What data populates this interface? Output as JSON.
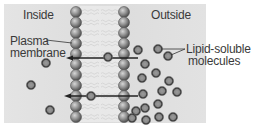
{
  "diagram": {
    "labels": {
      "inside": "Inside",
      "outside": "Outside",
      "plasma_membrane_line1": "Plasma",
      "plasma_membrane_line2": "membrane",
      "lipid_soluble_line1": "Lipid-soluble",
      "lipid_soluble_line2": "molecules"
    },
    "colors": {
      "panel": "#dedede",
      "head": "#8a8a8a",
      "molecule": "#7a7a7a",
      "arrow": "#222222",
      "text": "#3a3a3a"
    },
    "membrane": {
      "left_head_x": 76,
      "right_head_x": 124,
      "head_radius": 5.5,
      "head_ys": [
        12,
        22.5,
        33,
        43.5,
        54,
        64.5,
        75,
        85.5,
        96,
        106.5,
        117
      ]
    },
    "arrows": [
      {
        "y": 58,
        "from_x": 138,
        "to_x": 66
      },
      {
        "y": 96,
        "from_x": 138,
        "to_x": 64
      }
    ],
    "molecules_inside": [
      {
        "x": 46,
        "y": 63
      },
      {
        "x": 31,
        "y": 85
      },
      {
        "x": 50,
        "y": 110
      }
    ],
    "molecules_in_membrane": [
      {
        "x": 108,
        "y": 57
      },
      {
        "x": 91,
        "y": 96
      }
    ],
    "molecules_outside": [
      {
        "x": 138,
        "y": 50
      },
      {
        "x": 158,
        "y": 49
      },
      {
        "x": 168,
        "y": 56
      },
      {
        "x": 145,
        "y": 64
      },
      {
        "x": 156,
        "y": 73
      },
      {
        "x": 169,
        "y": 81
      },
      {
        "x": 142,
        "y": 78
      },
      {
        "x": 162,
        "y": 91
      },
      {
        "x": 177,
        "y": 92
      },
      {
        "x": 143,
        "y": 94
      },
      {
        "x": 158,
        "y": 104
      },
      {
        "x": 145,
        "y": 108
      },
      {
        "x": 136,
        "y": 111
      },
      {
        "x": 159,
        "y": 117
      },
      {
        "x": 173,
        "y": 117
      },
      {
        "x": 146,
        "y": 120
      },
      {
        "x": 132,
        "y": 118
      }
    ]
  }
}
